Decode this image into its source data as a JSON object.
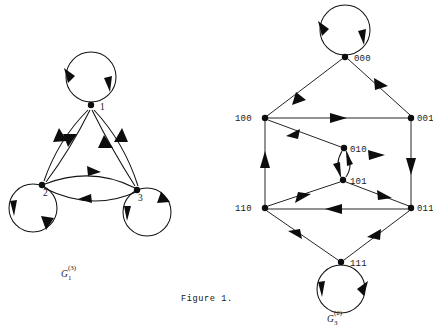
{
  "figure": {
    "caption": "Figure 1.",
    "background_color": "#ffffff",
    "ink_color": "#141414"
  },
  "graphs": [
    {
      "id": "left-graph",
      "name_base": "G",
      "name_subscript": "1",
      "name_superscript": "(3)",
      "name_full": "G_1^(3)",
      "node_count": 3,
      "nodes": [
        {
          "id": "n1",
          "label": "1",
          "x": 91,
          "y": 105,
          "label_dx": 9,
          "label_dy": 5
        },
        {
          "id": "n2",
          "label": "2",
          "x": 42,
          "y": 185,
          "label_dx": 1,
          "label_dy": 11
        },
        {
          "id": "n3",
          "label": "3",
          "x": 137,
          "y": 190,
          "label_dx": 1,
          "label_dy": 11
        }
      ],
      "self_loops": [
        {
          "at": "n1",
          "cx": 91,
          "cy": 77,
          "r": 25,
          "arrows": 2
        },
        {
          "at": "n2",
          "cx": 33,
          "cy": 208,
          "r": 24,
          "arrows": 2
        },
        {
          "at": "n3",
          "cx": 147,
          "cy": 212,
          "r": 24,
          "arrows": 2
        }
      ],
      "edges": [
        {
          "from": "n1",
          "to": "n2",
          "curve": "outer"
        },
        {
          "from": "n2",
          "to": "n1",
          "curve": "inner"
        },
        {
          "from": "n1",
          "to": "n3",
          "curve": "outer"
        },
        {
          "from": "n3",
          "to": "n1",
          "curve": "inner"
        },
        {
          "from": "n2",
          "to": "n3",
          "curve": "upper"
        },
        {
          "from": "n3",
          "to": "n2",
          "curve": "lower"
        }
      ],
      "edge_count": 6
    },
    {
      "id": "right-graph",
      "name_base": "G",
      "name_subscript": "3",
      "name_superscript": "(2)",
      "name_full": "G_3^(2)",
      "node_count": 8,
      "nodes": [
        {
          "id": "b000",
          "label": "000",
          "x": 345,
          "y": 57,
          "label_dx": 9,
          "label_dy": 4
        },
        {
          "id": "b100",
          "label": "100",
          "x": 265,
          "y": 118,
          "label_dx": -30,
          "label_dy": 3
        },
        {
          "id": "b001",
          "label": "001",
          "x": 411,
          "y": 118,
          "label_dx": 6,
          "label_dy": 3
        },
        {
          "id": "b010",
          "label": "010",
          "x": 344,
          "y": 148,
          "label_dx": 6,
          "label_dy": 4
        },
        {
          "id": "b101",
          "label": "101",
          "x": 343,
          "y": 180,
          "label_dx": 7,
          "label_dy": 4
        },
        {
          "id": "b110",
          "label": "110",
          "x": 265,
          "y": 208,
          "label_dx": -30,
          "label_dy": 3
        },
        {
          "id": "b011",
          "label": "011",
          "x": 411,
          "y": 208,
          "label_dx": 6,
          "label_dy": 3
        },
        {
          "id": "b111",
          "label": "111",
          "x": 341,
          "y": 262,
          "label_dx": 9,
          "label_dy": 4
        }
      ],
      "self_loops": [
        {
          "at": "b000",
          "cx": 345,
          "cy": 30,
          "r": 25,
          "arrows": 2
        },
        {
          "at": "b111",
          "cx": 341,
          "cy": 289,
          "r": 24,
          "arrows": 2
        }
      ],
      "edges": [
        {
          "from": "b000",
          "to": "b001"
        },
        {
          "from": "b100",
          "to": "b000"
        },
        {
          "from": "b100",
          "to": "b001"
        },
        {
          "from": "b010",
          "to": "b100"
        },
        {
          "from": "b001",
          "to": "b011"
        },
        {
          "from": "b010",
          "to": "b101"
        },
        {
          "from": "b101",
          "to": "b010"
        },
        {
          "from": "b110",
          "to": "b101"
        },
        {
          "from": "b101",
          "to": "b011"
        },
        {
          "from": "b011",
          "to": "b110"
        },
        {
          "from": "b110",
          "to": "b100"
        },
        {
          "from": "b011",
          "to": "b111"
        },
        {
          "from": "b111",
          "to": "b110"
        }
      ],
      "edge_count": 13
    }
  ]
}
